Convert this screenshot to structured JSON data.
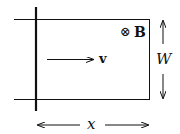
{
  "diagram": {
    "field_symbol": "⊗",
    "field_label": "B",
    "velocity_label": "v",
    "width_label": "W",
    "length_label": "x",
    "colors": {
      "stroke": "#111111",
      "background": "#ffffff"
    }
  }
}
